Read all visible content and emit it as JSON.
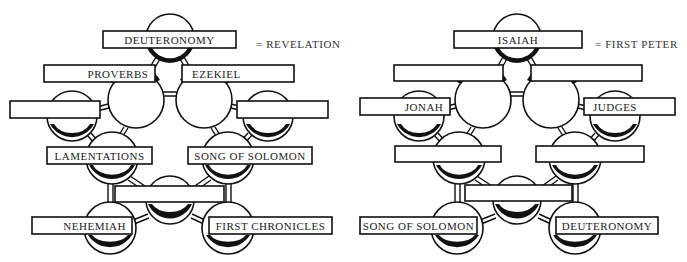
{
  "puzzles": [
    {
      "id": "left",
      "answer_label": "= REVELATION",
      "nodes": [
        {
          "pos": "top",
          "label": "DEUTERONOMY"
        },
        {
          "pos": "upper-left",
          "label": "PROVERBS"
        },
        {
          "pos": "upper-right",
          "label": "EZEKIEL"
        },
        {
          "pos": "far-left",
          "label": ""
        },
        {
          "pos": "far-right",
          "label": ""
        },
        {
          "pos": "lower-left",
          "label": "LAMENTATIONS"
        },
        {
          "pos": "lower-right",
          "label": "SONG OF SOLOMON"
        },
        {
          "pos": "bottom-center",
          "label": ""
        },
        {
          "pos": "bottom-left",
          "label": "NEHEMIAH"
        },
        {
          "pos": "bottom-right",
          "label": "FIRST CHRONICLES"
        }
      ]
    },
    {
      "id": "right",
      "answer_label": "= FIRST PETER",
      "nodes": [
        {
          "pos": "top",
          "label": "ISAIAH"
        },
        {
          "pos": "upper-left",
          "label": ""
        },
        {
          "pos": "upper-right",
          "label": ""
        },
        {
          "pos": "far-left",
          "label": "JONAH"
        },
        {
          "pos": "far-right",
          "label": "JUDGES"
        },
        {
          "pos": "lower-left",
          "label": ""
        },
        {
          "pos": "lower-right",
          "label": ""
        },
        {
          "pos": "bottom-center",
          "label": ""
        },
        {
          "pos": "bottom-left",
          "label": "SONG OF SOLOMON"
        },
        {
          "pos": "bottom-right",
          "label": "DEUTERONOMY"
        }
      ]
    }
  ],
  "colors": {
    "ink": "#111111",
    "paper": "#ffffff",
    "text": "#222222"
  }
}
